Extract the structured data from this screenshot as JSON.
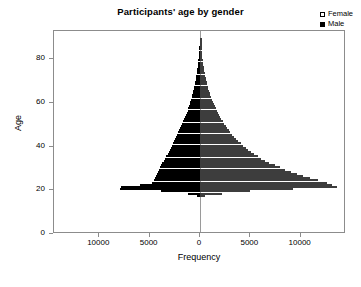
{
  "chart_data": {
    "type": "bar",
    "subtype": "population-pyramid",
    "title": "Participants' age by gender",
    "xlabel": "Frequency",
    "ylabel": "Age",
    "orientation": "horizontal",
    "grid": false,
    "legend_position": "top-right",
    "xlim": [
      -14500,
      14500
    ],
    "ylim": [
      0,
      93
    ],
    "xticks": [
      -10000,
      -5000,
      0,
      5000,
      10000
    ],
    "xticklabels": [
      "10000",
      "5000",
      "0",
      "5000",
      "10000"
    ],
    "yticks": [
      0,
      20,
      40,
      60,
      80
    ],
    "yticklabels": [
      "0",
      "20",
      "40",
      "60",
      "80"
    ],
    "series": [
      {
        "name": "Male",
        "color": "#000000",
        "direction": "left",
        "values": [
          0,
          0,
          0,
          0,
          0,
          0,
          0,
          0,
          0,
          0,
          0,
          0,
          0,
          0,
          0,
          0,
          0,
          300,
          1200,
          3900,
          7900,
          7800,
          6000,
          4800,
          4600,
          4500,
          4400,
          4300,
          4200,
          4100,
          4000,
          3900,
          3800,
          3600,
          3500,
          3400,
          3200,
          3100,
          2950,
          2850,
          2750,
          2650,
          2550,
          2450,
          2350,
          2250,
          2150,
          2050,
          1950,
          1850,
          1750,
          1650,
          1550,
          1450,
          1380,
          1300,
          1220,
          1150,
          1080,
          1010,
          950,
          890,
          830,
          780,
          720,
          670,
          620,
          570,
          520,
          480,
          440,
          400,
          360,
          330,
          300,
          270,
          240,
          210,
          185,
          160,
          140,
          120,
          100,
          85,
          70,
          58,
          46,
          36,
          27,
          20,
          14,
          9,
          5,
          2
        ]
      },
      {
        "name": "Female",
        "color": "#ffffff",
        "direction": "right",
        "values": [
          0,
          0,
          0,
          0,
          0,
          0,
          0,
          0,
          0,
          0,
          0,
          0,
          0,
          0,
          0,
          0,
          0,
          500,
          2200,
          5000,
          9200,
          13600,
          13100,
          12600,
          11700,
          10900,
          10200,
          9600,
          9000,
          8400,
          7900,
          7400,
          6900,
          6500,
          6100,
          5750,
          5400,
          5100,
          4800,
          4550,
          4300,
          4050,
          3800,
          3600,
          3400,
          3200,
          3000,
          2850,
          2700,
          2550,
          2400,
          2250,
          2120,
          2000,
          1880,
          1770,
          1660,
          1560,
          1460,
          1370,
          1280,
          1200,
          1120,
          1040,
          970,
          900,
          840,
          780,
          720,
          660,
          610,
          560,
          510,
          470,
          430,
          390,
          350,
          315,
          280,
          250,
          220,
          195,
          170,
          145,
          125,
          105,
          88,
          72,
          58,
          45,
          34,
          24,
          15,
          8
        ]
      }
    ],
    "ages": [
      0,
      1,
      2,
      3,
      4,
      5,
      6,
      7,
      8,
      9,
      10,
      11,
      12,
      13,
      14,
      15,
      16,
      17,
      18,
      19,
      20,
      21,
      22,
      23,
      24,
      25,
      26,
      27,
      28,
      29,
      30,
      31,
      32,
      33,
      34,
      35,
      36,
      37,
      38,
      39,
      40,
      41,
      42,
      43,
      44,
      45,
      46,
      47,
      48,
      49,
      50,
      51,
      52,
      53,
      54,
      55,
      56,
      57,
      58,
      59,
      60,
      61,
      62,
      63,
      64,
      65,
      66,
      67,
      68,
      69,
      70,
      71,
      72,
      73,
      74,
      75,
      76,
      77,
      78,
      79,
      80,
      81,
      82,
      83,
      84,
      85,
      86,
      87,
      88,
      89,
      90,
      91,
      92
    ]
  },
  "legend": {
    "entries": [
      {
        "label": "Female",
        "swatch": "white-square"
      },
      {
        "label": "Male",
        "swatch": "black-square"
      }
    ]
  }
}
